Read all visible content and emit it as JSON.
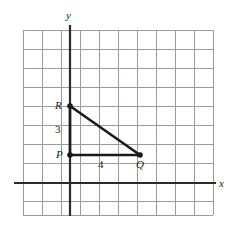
{
  "figure": {
    "background_color": "#ffffff",
    "width": 238,
    "height": 227
  },
  "grid": {
    "line_color": "#9a9aa4",
    "line_width": 1,
    "cell_size": 19,
    "x_start": 23,
    "x_end": 213,
    "y_start": 30,
    "y_end": 215,
    "columns": 11,
    "rows": 11
  },
  "axes": {
    "color": "#2b2b2b",
    "width": 2.2,
    "x_axis": {
      "label": "x",
      "y_pixel": 183,
      "x_from": 14,
      "x_to": 216
    },
    "y_axis": {
      "label": "y",
      "x_pixel": 70,
      "y_from": 25,
      "y_to": 216
    }
  },
  "triangle": {
    "stroke_color": "#1a1a1a",
    "stroke_width": 2.6,
    "vertices": [
      {
        "name": "R",
        "label": "R",
        "x": 70,
        "y": 106
      },
      {
        "name": "P",
        "label": "P",
        "x": 70,
        "y": 155
      },
      {
        "name": "Q",
        "label": "Q",
        "x": 140,
        "y": 155
      }
    ],
    "point_radius": 2.6,
    "sides": [
      {
        "name": "RP",
        "length_label": "3",
        "from": "R",
        "to": "P"
      },
      {
        "name": "PQ",
        "length_label": "4",
        "from": "P",
        "to": "Q"
      },
      {
        "name": "RQ",
        "length_label": "",
        "from": "R",
        "to": "Q"
      }
    ]
  },
  "labels": {
    "y_axis": "y",
    "x_axis": "x",
    "vertex_r": "R",
    "vertex_p": "P",
    "vertex_q": "Q",
    "side_rp": "3",
    "side_pq": "4"
  }
}
